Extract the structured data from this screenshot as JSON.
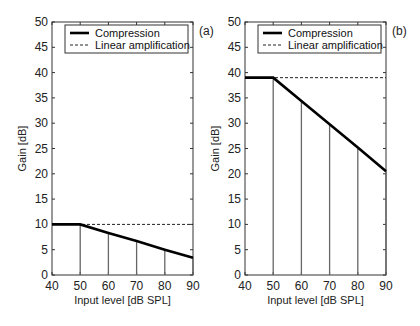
{
  "chart_data": [
    {
      "type": "line",
      "panel_label": "(a)",
      "xlabel": "Input level [dB SPL]",
      "ylabel": "Gain [dB]",
      "xlim": [
        40,
        90
      ],
      "ylim": [
        0,
        50
      ],
      "xticks": [
        40,
        50,
        60,
        70,
        80,
        90
      ],
      "yticks": [
        0,
        5,
        10,
        15,
        20,
        25,
        30,
        35,
        40,
        45,
        50
      ],
      "legend": [
        "Compression",
        "Linear amplification"
      ],
      "legend_position": "upper",
      "grid": false,
      "series": [
        {
          "name": "Compression",
          "style": "solid-thick",
          "x": [
            40,
            50,
            60,
            70,
            80,
            90
          ],
          "y": [
            10,
            10,
            8.3,
            6.7,
            5.0,
            3.4
          ]
        },
        {
          "name": "Linear amplification",
          "style": "dashed",
          "x": [
            40,
            90
          ],
          "y": [
            10,
            10
          ]
        }
      ],
      "stems_x": [
        50,
        60,
        70,
        80,
        90
      ]
    },
    {
      "type": "line",
      "panel_label": "(b)",
      "xlabel": "Input level [dB SPL]",
      "ylabel": "Gain [dB]",
      "xlim": [
        40,
        90
      ],
      "ylim": [
        0,
        50
      ],
      "xticks": [
        40,
        50,
        60,
        70,
        80,
        90
      ],
      "yticks": [
        0,
        5,
        10,
        15,
        20,
        25,
        30,
        35,
        40,
        45,
        50
      ],
      "legend": [
        "Compression",
        "Linear amplification"
      ],
      "legend_position": "upper",
      "grid": false,
      "series": [
        {
          "name": "Compression",
          "style": "solid-thick",
          "x": [
            40,
            50,
            60,
            70,
            80,
            90
          ],
          "y": [
            39,
            39,
            34.4,
            29.8,
            25.2,
            20.5
          ]
        },
        {
          "name": "Linear amplification",
          "style": "dashed",
          "x": [
            40,
            90
          ],
          "y": [
            39,
            39
          ]
        }
      ],
      "stems_x": [
        50,
        60,
        70,
        80,
        90
      ]
    }
  ]
}
